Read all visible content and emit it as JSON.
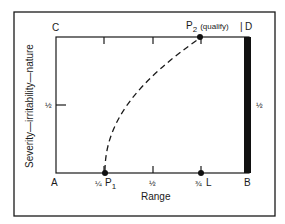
{
  "diagram": {
    "corners": {
      "top_left": "C",
      "top_right": "D",
      "bottom_left": "A",
      "bottom_right": "B"
    },
    "x_axis_label": "Range",
    "y_axis_label": "Severity—irritability—nature",
    "x_ticks": [
      "¼",
      "½",
      "¾"
    ],
    "y_tick_left": "½",
    "y_tick_right": "½",
    "points": {
      "p1": {
        "label": "P",
        "sub": "1"
      },
      "p2": {
        "label": "P",
        "sub": "2",
        "note": "(qualify)"
      },
      "l": {
        "label": "L"
      }
    },
    "colors": {
      "line": "#1a1a1a",
      "bar": "#111111",
      "background": "#ffffff"
    }
  }
}
